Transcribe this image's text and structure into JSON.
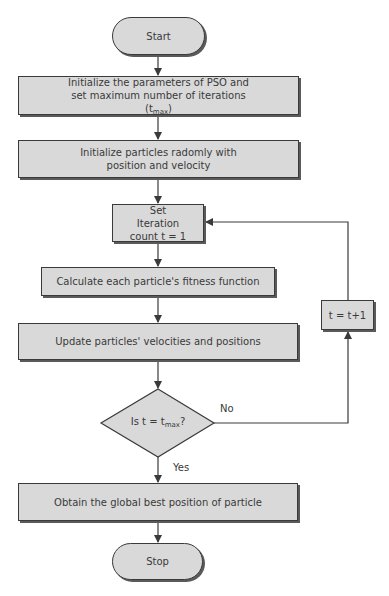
{
  "flowchart": {
    "colors": {
      "fill": "#d9d9d9",
      "stroke": "#3a3a3a",
      "shadow": "#5a5a5a",
      "text": "#3a3a3a"
    },
    "nodes": {
      "start": {
        "shape": "terminal",
        "label": "Start"
      },
      "init_params": {
        "shape": "process",
        "label": "Initialize the parameters of PSO and set maximum number of iterations (t",
        "label_sub": "max",
        "label_end": ")"
      },
      "init_particles": {
        "shape": "process",
        "label": "Initialize particles radomly with position and velocity"
      },
      "set_iteration": {
        "shape": "process",
        "label": "Set Iteration count t = 1"
      },
      "calc_fitness": {
        "shape": "process",
        "label": "Calculate each particle's fitness function"
      },
      "update": {
        "shape": "process",
        "label": "Update particles' velocities and positions"
      },
      "decision": {
        "shape": "decision",
        "label": "Is t = t",
        "label_sub": "max",
        "label_end": "?"
      },
      "increment": {
        "shape": "process",
        "label": "t = t+1"
      },
      "obtain_best": {
        "shape": "process",
        "label": "Obtain the global best position of particle"
      },
      "stop": {
        "shape": "terminal",
        "label": "Stop"
      }
    },
    "edge_labels": {
      "no": "No",
      "yes": "Yes"
    },
    "edges": [
      [
        "start",
        "init_params"
      ],
      [
        "init_params",
        "init_particles"
      ],
      [
        "init_particles",
        "set_iteration"
      ],
      [
        "set_iteration",
        "calc_fitness"
      ],
      [
        "calc_fitness",
        "update"
      ],
      [
        "update",
        "decision"
      ],
      [
        "decision",
        "increment",
        "No"
      ],
      [
        "increment",
        "set_iteration"
      ],
      [
        "decision",
        "obtain_best",
        "Yes"
      ],
      [
        "obtain_best",
        "stop"
      ]
    ]
  }
}
